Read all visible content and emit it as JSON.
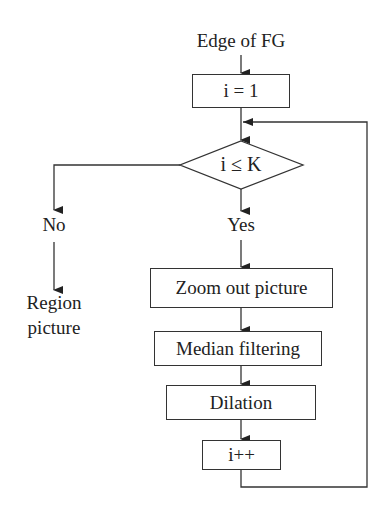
{
  "diagram": {
    "type": "flowchart",
    "start_label": "Edge of FG",
    "nodes": [
      {
        "id": "init",
        "shape": "rect",
        "text": "i = 1"
      },
      {
        "id": "cond",
        "shape": "diamond",
        "text": "i ≤ K"
      },
      {
        "id": "zoom",
        "shape": "rect",
        "text": "Zoom out picture"
      },
      {
        "id": "median",
        "shape": "rect",
        "text": "Median filtering"
      },
      {
        "id": "dilation",
        "shape": "rect",
        "text": "Dilation"
      },
      {
        "id": "inc",
        "shape": "rect",
        "text": "i++"
      }
    ],
    "branch_yes": "Yes",
    "branch_no": "No",
    "end_label_line1": "Region",
    "end_label_line2": "picture",
    "edges": [
      {
        "from": "Edge of FG",
        "to": "init"
      },
      {
        "from": "init",
        "to": "cond"
      },
      {
        "from": "cond",
        "to": "zoom",
        "label": "Yes"
      },
      {
        "from": "cond",
        "to": "Region picture",
        "label": "No"
      },
      {
        "from": "zoom",
        "to": "median"
      },
      {
        "from": "median",
        "to": "dilation"
      },
      {
        "from": "dilation",
        "to": "inc"
      },
      {
        "from": "inc",
        "to": "cond",
        "note": "loop back"
      }
    ]
  }
}
